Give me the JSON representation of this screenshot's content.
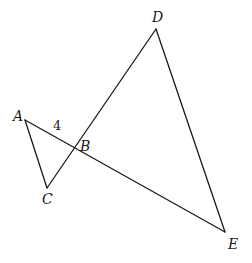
{
  "diagram": {
    "type": "geometry-figure",
    "points": {
      "A": {
        "label": "A",
        "x": 25,
        "y": 120,
        "label_x": 13,
        "label_y": 121
      },
      "B": {
        "label": "B",
        "x": 75,
        "y": 148,
        "label_x": 80,
        "label_y": 151
      },
      "C": {
        "label": "C",
        "x": 47,
        "y": 188,
        "label_x": 42,
        "label_y": 204
      },
      "D": {
        "label": "D",
        "x": 156,
        "y": 29,
        "label_x": 152,
        "label_y": 22
      },
      "E": {
        "label": "E",
        "x": 225,
        "y": 232,
        "label_x": 228,
        "label_y": 249
      }
    },
    "segments": [
      {
        "from": "A",
        "to": "E"
      },
      {
        "from": "C",
        "to": "D"
      },
      {
        "from": "A",
        "to": "C"
      },
      {
        "from": "D",
        "to": "E"
      }
    ],
    "annotations": [
      {
        "text": "4",
        "segment": "AB",
        "x": 53,
        "y": 130
      }
    ],
    "colors": {
      "stroke": "#1a1a1a",
      "background": "#ffffff"
    }
  }
}
